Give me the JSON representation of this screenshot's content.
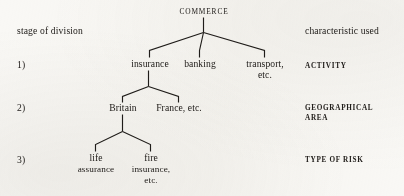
{
  "diagram": {
    "column_headers": {
      "left": "stage of division",
      "right": "characteristic used"
    },
    "root": {
      "label": "COMMERCE"
    },
    "rows": [
      {
        "number": "1)",
        "characteristic": "ACTIVITY",
        "nodes": [
          {
            "line1": "insurance",
            "line2": ""
          },
          {
            "line1": "banking",
            "line2": ""
          },
          {
            "line1": "transport,",
            "line2": "etc."
          }
        ]
      },
      {
        "number": "2)",
        "characteristic_line1": "GEOGRAPHICAL",
        "characteristic_line2": "AREA",
        "nodes": [
          {
            "line1": "Britain",
            "line2": ""
          },
          {
            "line1": "France, etc.",
            "line2": ""
          }
        ]
      },
      {
        "number": "3)",
        "characteristic": "TYPE OF RISK",
        "nodes": [
          {
            "line1": "life",
            "line2": "assurance",
            "line3": ""
          },
          {
            "line1": "fire",
            "line2": "insurance,",
            "line3": "etc."
          }
        ]
      }
    ],
    "colors": {
      "ink": "#221f1c",
      "paper": "#f7f6f3"
    }
  }
}
